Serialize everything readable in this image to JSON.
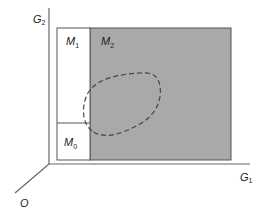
{
  "diagram": {
    "axes": {
      "vertical": {
        "label": "G",
        "sub": "2"
      },
      "horizontal": {
        "label": "G",
        "sub": "1"
      },
      "depth": {
        "label": "O"
      }
    },
    "regions": [
      {
        "id": "M1",
        "label": "M",
        "sub": "1",
        "fill": "#ffffff"
      },
      {
        "id": "M2",
        "label": "M",
        "sub": "2",
        "fill": "#a9a9a9"
      },
      {
        "id": "M0",
        "label": "M",
        "sub": "0",
        "fill": "#ffffff"
      }
    ],
    "colors": {
      "stroke": "#555555",
      "shaded": "#a9a9a9",
      "dashed": "#444444"
    }
  }
}
